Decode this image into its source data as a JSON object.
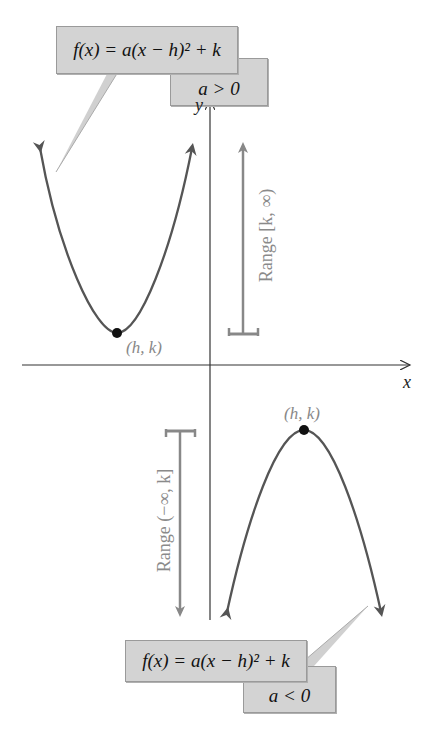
{
  "top": {
    "formula": "f(x) = a(x − h)² + k",
    "condition": "a > 0",
    "vertex_label": "(h, k)",
    "range_label": "Range [k, ∞)"
  },
  "bottom": {
    "formula": "f(x) = a(x − h)² + k",
    "condition": "a < 0",
    "vertex_label": "(h, k)",
    "range_label": "Range (−∞, k]"
  },
  "axes": {
    "x_label": "x",
    "y_label": "y"
  },
  "colors": {
    "curve": "#555555",
    "axis": "#333333",
    "range": "#888888",
    "box": "#d3d3d3"
  }
}
